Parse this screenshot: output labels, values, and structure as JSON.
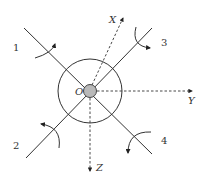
{
  "diagram": {
    "center_label": "O",
    "axes": [
      {
        "id": "x",
        "label": "X"
      },
      {
        "id": "y",
        "label": "Y"
      },
      {
        "id": "z",
        "label": "Z"
      }
    ],
    "rotors": [
      {
        "id": "1",
        "label": "1"
      },
      {
        "id": "2",
        "label": "2"
      },
      {
        "id": "3",
        "label": "3"
      },
      {
        "id": "4",
        "label": "4"
      }
    ],
    "colors": {
      "line": "#333333",
      "hub_fill": "#b9b9b9",
      "background": "#ffffff"
    }
  }
}
